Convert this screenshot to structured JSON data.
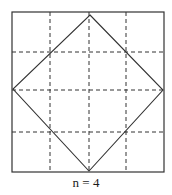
{
  "diagram": {
    "caption": "n = 4",
    "square": {
      "x": 12,
      "y": 12,
      "width": 152,
      "height": 160
    },
    "vertical_dashed_lines_x": [
      50,
      89,
      126
    ],
    "horizontal_dashed_lines_y": [
      52,
      90,
      132
    ],
    "diamond": [
      [
        90,
        15
      ],
      [
        163,
        90
      ],
      [
        89,
        171
      ],
      [
        13,
        89
      ]
    ],
    "colors": {
      "stroke": "#333333",
      "background": "#ffffff"
    }
  }
}
